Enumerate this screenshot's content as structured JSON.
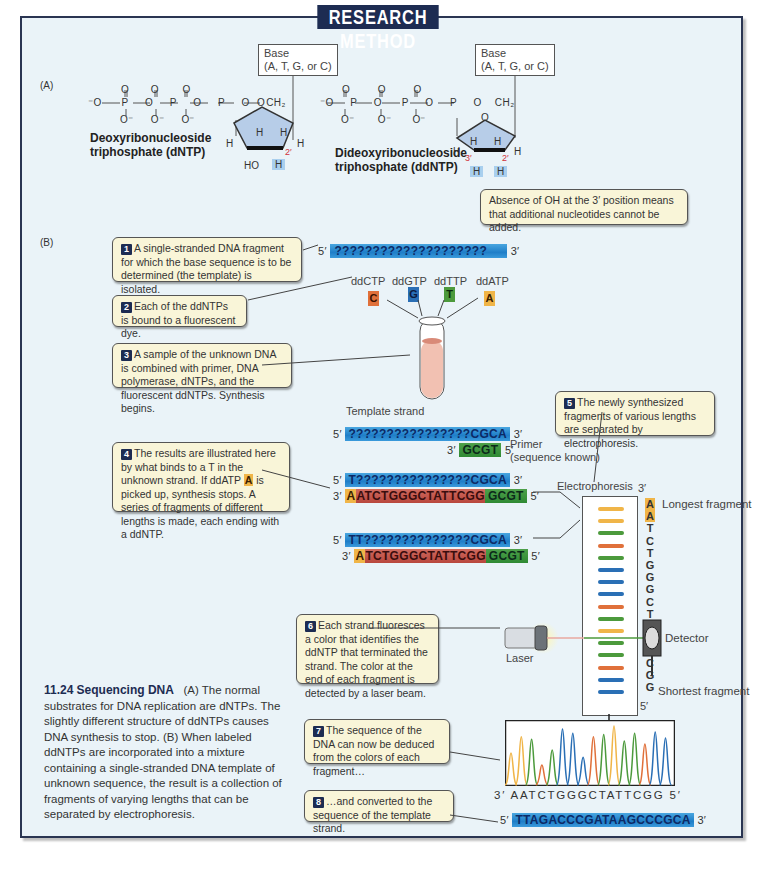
{
  "title": "RESEARCH METHOD",
  "colors": {
    "frame_bg": "#eaf3f8",
    "title_bg": "#1d2c52",
    "callout_bg": "#f9f5d8",
    "C": "#e0703a",
    "G": "#2a6fb5",
    "T": "#4c9a3c",
    "A": "#f0b548",
    "strand_blue": "#2585cc",
    "strand_red": "#c0524a",
    "strand_green": "#3b8f3b"
  },
  "panelA": {
    "label": "(A)",
    "dntp": {
      "base_box": [
        "Base",
        "(A, T, G, or C)"
      ],
      "name": [
        "Deoxyribonucleoside",
        "triphosphate (dNTP)"
      ],
      "phosphate": "⁻O—P—O—P—O—P—O—CH₂",
      "oxygen_top": "O",
      "oxygen_bottom": "O⁻",
      "ring_o": "O",
      "h_labels": [
        "H",
        "H",
        "H",
        "H"
      ],
      "prime2": "2′",
      "ho": "HO",
      "h_blue": "H"
    },
    "ddntp": {
      "base_box": [
        "Base",
        "(A, T, G, or C)"
      ],
      "name": [
        "Dideoxyribonucleoside",
        "triphosphate (ddNTP)"
      ],
      "prime3": "3′",
      "prime2": "2′",
      "h_blue": [
        "H",
        "H"
      ]
    },
    "callout": "Absence of OH at the 3′ position means that additional nucleotides cannot be added."
  },
  "panelB": {
    "label": "(B)",
    "steps": [
      {
        "num": "1",
        "text": "A single-stranded DNA fragment for which the base sequence is to be determined (the template) is isolated."
      },
      {
        "num": "2",
        "text": "Each of the ddNTPs is bound to a fluorescent dye."
      },
      {
        "num": "3",
        "text": "A sample of the unknown DNA is combined with primer, DNA polymerase, dNTPs, and the fluorescent ddNTPs. Synthesis begins."
      },
      {
        "num": "4",
        "text_before": "The results are illustrated here by what binds to a T in the unknown strand. If ddATP ",
        "highlight": "A",
        "text_after": " is picked up, synthesis stops. A series of fragments of different lengths is made, each ending with a ddNTP."
      },
      {
        "num": "5",
        "text": "The newly synthesized fragments of various lengths are separated by electrophoresis."
      },
      {
        "num": "6",
        "text": "Each strand fluoresces a color that identifies the ddNTP that terminated the strand. The color at the end of each fragment is detected by a laser beam."
      },
      {
        "num": "7",
        "text": "The sequence of the DNA can now be deduced from the colors of each fragment…"
      },
      {
        "num": "8",
        "text": "…and converted to the sequence of the template strand."
      }
    ],
    "template_unknown": {
      "five": "5′",
      "seq": "????????????????????",
      "three": "3′"
    },
    "ddntps": [
      {
        "name": "ddCTP",
        "letter": "C"
      },
      {
        "name": "ddGTP",
        "letter": "G"
      },
      {
        "name": "ddTTP",
        "letter": "T"
      },
      {
        "name": "ddATP",
        "letter": "A"
      }
    ],
    "template_strand_label": "Template strand",
    "primer_label": [
      "Primer",
      "(sequence known)"
    ],
    "template": {
      "five": "5′",
      "unknown": "????????????????",
      "known": "CGCA",
      "three": "3′"
    },
    "primer": {
      "three": "3′",
      "seq": "GCGT",
      "five": "5′"
    },
    "fragment1": {
      "top": {
        "five": "5′",
        "t": "T",
        "unknown": "???????????????",
        "known": "CGCA",
        "three": "3′"
      },
      "bottom": {
        "three": "3′",
        "a": "A",
        "seq": "ATCTGGGCTATTCGG",
        "primer": "GCGT",
        "five": "5′"
      }
    },
    "fragment2": {
      "top": {
        "five": "5′",
        "t": "TT",
        "unknown": "??????????????",
        "known": "CGCA",
        "three": "3′"
      },
      "bottom": {
        "three": "3′",
        "a": "A",
        "seq": "TCTGGGCTATTCGG",
        "primer": "GCGT",
        "five": "5′"
      }
    },
    "electrophoresis": {
      "label": "Electrophoresis",
      "three": "3′",
      "five": "5′",
      "longest": "Longest fragment",
      "shortest": "Shortest fragment",
      "bands": [
        "A",
        "A",
        "T",
        "C",
        "T",
        "G",
        "G",
        "G",
        "C",
        "T",
        "A",
        "T",
        "T",
        "C",
        "G",
        "G"
      ]
    },
    "laser_label": "Laser",
    "detector_label": "Detector",
    "chromatogram": {
      "readout_prefix": "3′",
      "readout": "AATCTGGGCTATTCGG",
      "readout_suffix": "5′",
      "peaks": [
        0.55,
        0.82,
        0.78,
        0.35,
        0.6,
        0.95,
        0.88,
        0.48,
        0.82,
        0.86,
        1.0,
        0.75,
        0.88,
        0.7,
        0.9,
        0.8
      ]
    },
    "final_sequence": {
      "five": "5′",
      "seq": "TTAGACCCGATAAGCCCGCA",
      "three": "3′"
    }
  },
  "caption": {
    "figure": "11.24",
    "title": "Sequencing DNA",
    "text": "(A) The normal substrates for DNA replication are dNTPs. The slightly different structure of ddNTPs causes DNA synthesis to stop. (B) When labeled ddNTPs are incorporated into a mixture containing a single-stranded DNA template of unknown sequence, the result is a collection of fragments of varying lengths that can be separated by electrophoresis."
  }
}
